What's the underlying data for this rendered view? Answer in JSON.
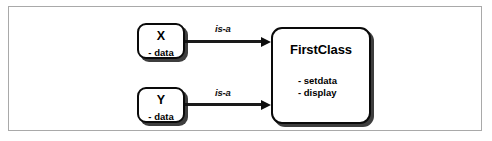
{
  "diagram": {
    "type": "uml-class-inheritance",
    "boxes": [
      {
        "id": "x",
        "title": "X",
        "members": [
          "- data"
        ]
      },
      {
        "id": "y",
        "title": "Y",
        "members": [
          "- data"
        ]
      },
      {
        "id": "firstclass",
        "title": "FirstClass",
        "members": [
          "- setdata",
          "- display"
        ]
      }
    ],
    "arrows": [
      {
        "id": "x-to-firstclass",
        "label": "is-a",
        "from": "X",
        "to": "FirstClass"
      },
      {
        "id": "y-to-firstclass",
        "label": "is-a",
        "from": "Y",
        "to": "FirstClass"
      }
    ],
    "colors": {
      "frame_border": "#a9a9a9",
      "box_border": "#0a0a0a",
      "box_fill": "#ffffff",
      "arrow": "#1a1a1a",
      "text": "#000000",
      "background": "#ffffff"
    }
  }
}
